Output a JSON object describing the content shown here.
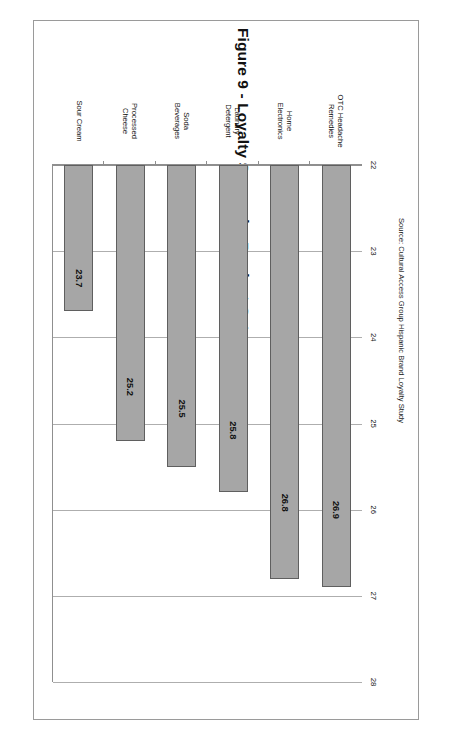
{
  "document": {
    "figure_title": "Figure 9 - Loyalty Scores by Product Category",
    "source_note": "Source: Cultural Access Group Hispanic Brand Loyalty Study"
  },
  "chart_data": {
    "type": "bar",
    "orientation": "horizontal",
    "title": "Figure 9 - Loyalty Scores by Product Category",
    "subtitle": "",
    "xlabel": "",
    "ylabel": "",
    "categories": [
      "OTC Headache Remedies",
      "Home Electronics",
      "Laundry Detergent",
      "Soda Beverages",
      "Processed Cheese",
      "Sour Cream"
    ],
    "category_lines": [
      [
        "OTC Headache",
        "Remedies"
      ],
      [
        "Home",
        "Electronics"
      ],
      [
        "Laundry",
        "Detergent"
      ],
      [
        "Soda",
        "Beverages"
      ],
      [
        "Processed",
        "Cheese"
      ],
      [
        "Sour Cream"
      ]
    ],
    "values": [
      26.9,
      26.8,
      25.8,
      25.5,
      25.2,
      23.7
    ],
    "value_labels": [
      "26.9",
      "26.8",
      "25.8",
      "25.5",
      "25.2",
      "23.7"
    ],
    "xlim": [
      22,
      28
    ],
    "xticks": [
      22,
      23,
      24,
      25,
      26,
      27,
      28
    ],
    "xtick_labels": [
      "22",
      "23",
      "24",
      "25",
      "26",
      "27",
      "28"
    ],
    "grid": true,
    "legend": null,
    "legend_position": "none",
    "series_color": "#a6a6a6",
    "series_border_color": "#5f5f5f",
    "grid_color": "#aeaeae",
    "axis_color": "#8f8f8f",
    "page_border_color": "#9a9a9a"
  }
}
